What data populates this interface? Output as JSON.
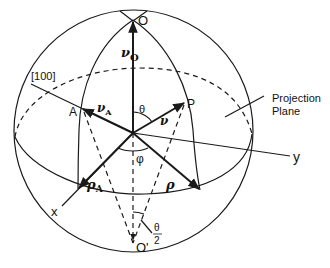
{
  "diagram": {
    "type": "stereographic-projection-sphere",
    "colors": {
      "line": "#1a1a1a",
      "background": "#ffffff"
    },
    "points": {
      "north_pole": "O",
      "south_pole": "O'",
      "pole_A": "A",
      "pole_P": "P"
    },
    "axes": {
      "x": "x",
      "y": "y",
      "direction_100": "[100]"
    },
    "vectors": {
      "nu_O": {
        "symbol": "ν",
        "sub": "O"
      },
      "nu_A": {
        "symbol": "ν",
        "sub": "A"
      },
      "nu": {
        "symbol": "ν",
        "sub": ""
      },
      "rho_A": {
        "symbol": "ρ",
        "sub": "A"
      },
      "rho": {
        "symbol": "ρ",
        "sub": ""
      }
    },
    "angles": {
      "theta": "θ",
      "phi": "φ",
      "half_theta_num": "θ",
      "half_theta_den": "2"
    },
    "annotations": {
      "projection_plane_line1": "Projection",
      "projection_plane_line2": "Plane"
    }
  }
}
